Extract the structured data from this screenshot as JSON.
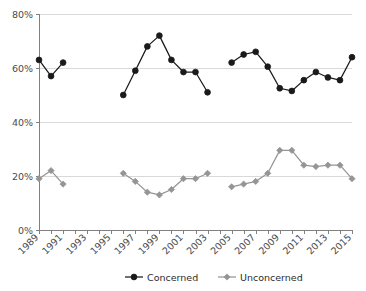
{
  "chart_data": {
    "type": "line",
    "title": "",
    "subtitle": "",
    "xlabel": "",
    "ylabel": "",
    "ylim": [
      0,
      80
    ],
    "xlim": [
      1989,
      2015
    ],
    "grid": true,
    "legend_position": "bottom",
    "ytick_labels": [
      "0%",
      "20%",
      "40%",
      "60%",
      "80%"
    ],
    "ytick_values": [
      0,
      20,
      40,
      60,
      80
    ],
    "x": [
      1989,
      1990,
      1991,
      1992,
      1993,
      1994,
      1995,
      1996,
      1997,
      1998,
      1999,
      2000,
      2001,
      2002,
      2003,
      2004,
      2005,
      2006,
      2007,
      2008,
      2009,
      2010,
      2011,
      2012,
      2013,
      2014,
      2015
    ],
    "xtick_labels": [
      "1989",
      "1991",
      "1993",
      "1995",
      "1997",
      "1999",
      "2001",
      "2003",
      "2005",
      "2007",
      "2009",
      "2011",
      "2013",
      "2015"
    ],
    "xtick_label_values": [
      1989,
      1991,
      1993,
      1995,
      1997,
      1999,
      2001,
      2003,
      2005,
      2007,
      2009,
      2011,
      2013,
      2015
    ],
    "series": [
      {
        "name": "Concerned",
        "color": "#1a1a1a",
        "marker": "circle",
        "values": [
          63,
          57,
          62,
          null,
          null,
          null,
          null,
          50,
          59,
          68,
          72,
          63,
          58.5,
          58.5,
          51,
          null,
          62,
          65,
          66,
          60.5,
          52.5,
          51.5,
          55.5,
          58.5,
          56.5,
          55.5,
          64
        ]
      },
      {
        "name": "Unconcerned",
        "color": "#959595",
        "marker": "diamond",
        "values": [
          19,
          22,
          17,
          null,
          null,
          null,
          null,
          21,
          18,
          14,
          13,
          15,
          19,
          19,
          21,
          null,
          16,
          17,
          18,
          21,
          29.5,
          29.5,
          24,
          23.5,
          24,
          24,
          19
        ]
      }
    ]
  },
  "legend": {
    "items": [
      {
        "label": "Concerned"
      },
      {
        "label": "Unconcerned"
      }
    ]
  }
}
